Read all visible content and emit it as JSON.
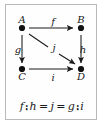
{
  "figure": {
    "kind": "commutative-square-diagram",
    "background_color": "#ffffff",
    "frame_color": "#b9b9b9",
    "ink_color": "#1a1a1a"
  },
  "diagram": {
    "nodes": [
      {
        "id": "A",
        "label": "A",
        "label_position": "above",
        "x": 16,
        "y": 23
      },
      {
        "id": "B",
        "label": "B",
        "label_position": "above",
        "x": 75,
        "y": 23
      },
      {
        "id": "C",
        "label": "C",
        "label_position": "below",
        "x": 16,
        "y": 64
      },
      {
        "id": "D",
        "label": "D",
        "label_position": "below",
        "x": 75,
        "y": 64
      }
    ],
    "arrows": [
      {
        "id": "f",
        "label": "f",
        "from": "A",
        "to": "B",
        "direction": "right",
        "label_position": "above"
      },
      {
        "id": "g",
        "label": "g",
        "from": "A",
        "to": "C",
        "direction": "down",
        "label_position": "left"
      },
      {
        "id": "h",
        "label": "h",
        "from": "B",
        "to": "D",
        "direction": "down",
        "label_position": "right"
      },
      {
        "id": "i",
        "label": "i",
        "from": "C",
        "to": "D",
        "direction": "right",
        "label_position": "below"
      },
      {
        "id": "j",
        "label": "j",
        "from": "A",
        "to": "D",
        "direction": "diagonal",
        "label_position": "middle"
      }
    ]
  },
  "equation": {
    "full_text": "f ⨟ h = j = g ⨟ i",
    "composition_symbol": "⨟",
    "equals_symbol": "=",
    "terms": {
      "left_first": "f",
      "left_second": "h",
      "middle": "j",
      "right_first": "g",
      "right_second": "i"
    }
  }
}
